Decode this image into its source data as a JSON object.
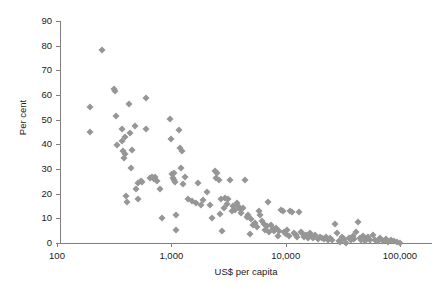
{
  "chart_data": {
    "type": "scatter",
    "title": "",
    "xlabel": "US$ per capita",
    "ylabel": "Per cent",
    "xscale": "log",
    "yscale": "linear",
    "xlim": [
      100,
      100000
    ],
    "ylim": [
      0,
      90
    ],
    "grid": false,
    "legend": null,
    "marker": {
      "shape": "diamond",
      "color": "#969696",
      "size": 5
    },
    "axis_color": "#808080",
    "xticks": [
      100,
      1000,
      10000,
      100000
    ],
    "xtick_labels": [
      "100",
      "1,000",
      "10,000",
      "100,000"
    ],
    "yticks": [
      0,
      10,
      20,
      30,
      40,
      50,
      60,
      70,
      80,
      90
    ],
    "ytick_labels": [
      "0",
      "10",
      "20",
      "30",
      "40",
      "50",
      "60",
      "70",
      "80",
      "90"
    ],
    "points": [
      [
        196,
        55.2
      ],
      [
        193,
        45.0
      ],
      [
        246,
        78.3
      ],
      [
        318,
        62.6
      ],
      [
        322,
        61.7
      ],
      [
        330,
        51.3
      ],
      [
        336,
        39.8
      ],
      [
        368,
        46.4
      ],
      [
        372,
        41.2
      ],
      [
        380,
        37.3
      ],
      [
        384,
        34.6
      ],
      [
        394,
        35.9
      ],
      [
        396,
        42.8
      ],
      [
        400,
        19.1
      ],
      [
        406,
        16.5
      ],
      [
        430,
        56.5
      ],
      [
        436,
        44.5
      ],
      [
        444,
        30.6
      ],
      [
        452,
        37.8
      ],
      [
        478,
        47.5
      ],
      [
        492,
        21.9
      ],
      [
        508,
        24.2
      ],
      [
        516,
        17.7
      ],
      [
        540,
        25.1
      ],
      [
        556,
        24.9
      ],
      [
        596,
        58.9
      ],
      [
        606,
        46.1
      ],
      [
        650,
        26.4
      ],
      [
        676,
        26.7
      ],
      [
        702,
        26.1
      ],
      [
        716,
        26.8
      ],
      [
        748,
        25.0
      ],
      [
        790,
        21.8
      ],
      [
        830,
        10.1
      ],
      [
        980,
        50.2
      ],
      [
        995,
        42.3
      ],
      [
        1010,
        27.9
      ],
      [
        1030,
        26.2
      ],
      [
        1045,
        25.5
      ],
      [
        1060,
        28.3
      ],
      [
        1075,
        24.6
      ],
      [
        1090,
        11.5
      ],
      [
        1105,
        5.1
      ],
      [
        1160,
        46.0
      ],
      [
        1185,
        38.4
      ],
      [
        1210,
        30.6
      ],
      [
        1240,
        37.3
      ],
      [
        1270,
        24.1
      ],
      [
        1330,
        26.6
      ],
      [
        1390,
        17.9
      ],
      [
        1520,
        17.2
      ],
      [
        1640,
        16.4
      ],
      [
        1720,
        24.4
      ],
      [
        1810,
        15.6
      ],
      [
        1900,
        17.4
      ],
      [
        2050,
        20.6
      ],
      [
        2180,
        15.5
      ],
      [
        2260,
        10.3
      ],
      [
        2400,
        29.2
      ],
      [
        2460,
        26.3
      ],
      [
        2520,
        28.5
      ],
      [
        2600,
        25.6
      ],
      [
        2680,
        11.9
      ],
      [
        2720,
        17.9
      ],
      [
        2790,
        5.0
      ],
      [
        2860,
        14.2
      ],
      [
        2950,
        18.3
      ],
      [
        3050,
        16.0
      ],
      [
        3150,
        17.8
      ],
      [
        3260,
        25.6
      ],
      [
        3380,
        12.9
      ],
      [
        3480,
        14.8
      ],
      [
        3600,
        13.4
      ],
      [
        3720,
        16.2
      ],
      [
        3850,
        15.1
      ],
      [
        3980,
        13.8
      ],
      [
        4100,
        12.0
      ],
      [
        4250,
        14.3
      ],
      [
        4400,
        25.4
      ],
      [
        4550,
        10.4
      ],
      [
        4700,
        11.3
      ],
      [
        4850,
        3.5
      ],
      [
        5000,
        9.6
      ],
      [
        5200,
        7.4
      ],
      [
        5400,
        8.2
      ],
      [
        5600,
        6.3
      ],
      [
        5800,
        13.0
      ],
      [
        6000,
        11.2
      ],
      [
        6200,
        9.0
      ],
      [
        6400,
        7.8
      ],
      [
        6600,
        5.4
      ],
      [
        6800,
        6.8
      ],
      [
        7000,
        16.5
      ],
      [
        7200,
        4.3
      ],
      [
        7450,
        7.1
      ],
      [
        7700,
        5.6
      ],
      [
        7950,
        4.8
      ],
      [
        8200,
        6.2
      ],
      [
        8500,
        2.9
      ],
      [
        8800,
        5.0
      ],
      [
        9100,
        13.2
      ],
      [
        9400,
        12.9
      ],
      [
        9700,
        4.4
      ],
      [
        10000,
        3.6
      ],
      [
        10300,
        5.1
      ],
      [
        10700,
        2.8
      ],
      [
        11000,
        13.0
      ],
      [
        11400,
        12.7
      ],
      [
        11800,
        4.0
      ],
      [
        12200,
        3.2
      ],
      [
        12600,
        2.6
      ],
      [
        13000,
        12.6
      ],
      [
        13500,
        4.6
      ],
      [
        14000,
        3.9
      ],
      [
        14500,
        2.4
      ],
      [
        15000,
        3.1
      ],
      [
        15600,
        2.2
      ],
      [
        16200,
        4.1
      ],
      [
        16800,
        2.7
      ],
      [
        17500,
        2.0
      ],
      [
        18200,
        3.4
      ],
      [
        19000,
        1.8
      ],
      [
        19800,
        2.5
      ],
      [
        20600,
        2.1
      ],
      [
        21500,
        1.6
      ],
      [
        22400,
        2.3
      ],
      [
        23400,
        1.4
      ],
      [
        24400,
        1.9
      ],
      [
        25500,
        1.2
      ],
      [
        27000,
        7.6
      ],
      [
        28000,
        4.2
      ],
      [
        29000,
        1.0
      ],
      [
        30000,
        0.6
      ],
      [
        31000,
        2.4
      ],
      [
        32500,
        1.5
      ],
      [
        34000,
        0.0
      ],
      [
        35500,
        2.0
      ],
      [
        37000,
        1.1
      ],
      [
        38500,
        2.8
      ],
      [
        40000,
        1.7
      ],
      [
        41500,
        4.3
      ],
      [
        43000,
        8.7
      ],
      [
        44500,
        2.2
      ],
      [
        46000,
        1.3
      ],
      [
        47500,
        3.0
      ],
      [
        49000,
        0.8
      ],
      [
        51000,
        1.9
      ],
      [
        53000,
        2.5
      ],
      [
        55000,
        1.1
      ],
      [
        58000,
        3.3
      ],
      [
        61000,
        1.4
      ],
      [
        64000,
        0.7
      ],
      [
        67000,
        2.1
      ],
      [
        71000,
        1.0
      ],
      [
        75000,
        1.6
      ],
      [
        79000,
        0.5
      ],
      [
        84000,
        1.3
      ],
      [
        89000,
        0.9
      ],
      [
        95000,
        0.4
      ],
      [
        100000,
        0.2
      ]
    ]
  }
}
